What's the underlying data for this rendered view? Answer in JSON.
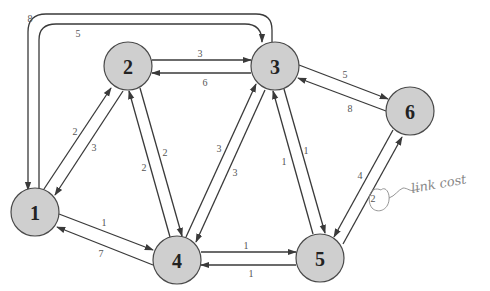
{
  "diagram": {
    "type": "directed weighted network graph",
    "nodes": [
      {
        "id": "1",
        "label": "1",
        "cx": 35,
        "cy": 212
      },
      {
        "id": "2",
        "label": "2",
        "cx": 128,
        "cy": 66
      },
      {
        "id": "3",
        "label": "3",
        "cx": 275,
        "cy": 66
      },
      {
        "id": "4",
        "label": "4",
        "cx": 177,
        "cy": 260
      },
      {
        "id": "5",
        "label": "5",
        "cx": 320,
        "cy": 258
      },
      {
        "id": "6",
        "label": "6",
        "cx": 410,
        "cy": 111
      }
    ],
    "edges": [
      {
        "from": "1",
        "to": "2",
        "cost": "2"
      },
      {
        "from": "2",
        "to": "1",
        "cost": "3"
      },
      {
        "from": "2",
        "to": "3",
        "cost": "3"
      },
      {
        "from": "3",
        "to": "2",
        "cost": "6"
      },
      {
        "from": "3",
        "to": "6",
        "cost": "5"
      },
      {
        "from": "6",
        "to": "3",
        "cost": "8"
      },
      {
        "from": "1",
        "to": "4",
        "cost": "1"
      },
      {
        "from": "4",
        "to": "1",
        "cost": "7"
      },
      {
        "from": "4",
        "to": "5",
        "cost": "1"
      },
      {
        "from": "5",
        "to": "4",
        "cost": "1"
      },
      {
        "from": "4",
        "to": "2",
        "cost": "2"
      },
      {
        "from": "2",
        "to": "4",
        "cost": "2"
      },
      {
        "from": "4",
        "to": "3",
        "cost": "3"
      },
      {
        "from": "3",
        "to": "4",
        "cost": "3"
      },
      {
        "from": "5",
        "to": "3",
        "cost": "1"
      },
      {
        "from": "3",
        "to": "5",
        "cost": "1"
      },
      {
        "from": "5",
        "to": "6",
        "cost": "2"
      },
      {
        "from": "6",
        "to": "5",
        "cost": "4"
      },
      {
        "from": "1",
        "to": "3",
        "cost": "5"
      },
      {
        "from": "3",
        "to": "1",
        "cost": "8"
      }
    ],
    "annotation": {
      "text": "link cost",
      "circled_cost": "2"
    }
  }
}
